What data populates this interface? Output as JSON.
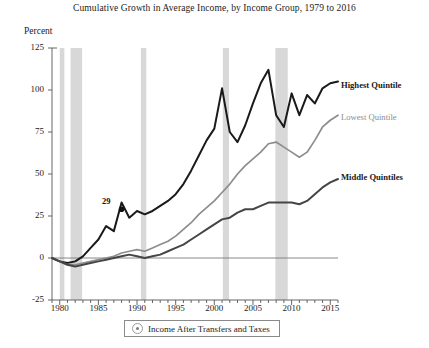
{
  "chart_data": {
    "type": "line",
    "title": "Cumulative Growth in Average Income, by Income Group, 1979 to 2016",
    "ylabel": "Percent",
    "xlabel": "",
    "xlim": [
      1979,
      2016
    ],
    "ylim": [
      -25,
      125
    ],
    "grid": false,
    "legend_position": "bottom-center",
    "legend_entries": [
      "Income After Transfers and Taxes"
    ],
    "legend_icon": "target-circle-icon",
    "y_ticks": [
      -25,
      0,
      25,
      50,
      75,
      100,
      125
    ],
    "y_tick_labels": [
      "-25",
      "0",
      "25",
      "50",
      "75",
      "100",
      "125"
    ],
    "x_ticks": [
      1980,
      1985,
      1990,
      1995,
      2000,
      2005,
      2010,
      2015
    ],
    "x_tick_labels": [
      "1980",
      "1985",
      "1990",
      "1995",
      "2000",
      "2005",
      "2010",
      "2015"
    ],
    "x_minor_ticks": [
      1979,
      1980,
      1981,
      1982,
      1983,
      1984,
      1985,
      1986,
      1987,
      1988,
      1989,
      1990,
      1991,
      1992,
      1993,
      1994,
      1995,
      1996,
      1997,
      1998,
      1999,
      2000,
      2001,
      2002,
      2003,
      2004,
      2005,
      2006,
      2007,
      2008,
      2009,
      2010,
      2011,
      2012,
      2013,
      2014,
      2015,
      2016
    ],
    "zero_line": 0,
    "colors": {
      "highest_quintile": "#1a1a1a",
      "lowest_quintile": "#8d8d8d",
      "middle_quintiles": "#454545",
      "recession_band": "#d8d8d8",
      "axis": "#555555",
      "zero_line": "#7b7b7b"
    },
    "recession_bands": [
      {
        "start": 1980.0,
        "end": 1980.6
      },
      {
        "start": 1981.4,
        "end": 1982.9
      },
      {
        "start": 1990.5,
        "end": 1991.2
      },
      {
        "start": 2001.1,
        "end": 2001.9
      },
      {
        "start": 2007.9,
        "end": 2009.5
      }
    ],
    "annotations": [
      {
        "label": "29",
        "series": "Highest Quintile",
        "x": 1988,
        "y": 29
      }
    ],
    "x": [
      1979,
      1980,
      1981,
      1982,
      1983,
      1984,
      1985,
      1986,
      1987,
      1988,
      1989,
      1990,
      1991,
      1992,
      1993,
      1994,
      1995,
      1996,
      1997,
      1998,
      1999,
      2000,
      2001,
      2002,
      2003,
      2004,
      2005,
      2006,
      2007,
      2008,
      2009,
      2010,
      2011,
      2012,
      2013,
      2014,
      2015,
      2016
    ],
    "series": [
      {
        "name": "Highest Quintile",
        "color": "#1a1a1a",
        "emphasis": "bold",
        "values": [
          0,
          -2,
          -3,
          -2,
          1,
          6,
          11,
          19,
          16,
          33,
          24,
          28,
          26,
          28,
          31,
          34,
          38,
          44,
          52,
          61,
          70,
          77,
          101,
          75,
          69,
          79,
          92,
          104,
          112,
          85,
          78,
          98,
          85,
          97,
          92,
          101,
          104,
          105
        ]
      },
      {
        "name": "Lowest Quintile",
        "color": "#8d8d8d",
        "emphasis": "regular",
        "values": [
          0,
          -2,
          -4,
          -4,
          -3,
          -2,
          -1,
          0,
          1,
          3,
          4,
          5,
          4,
          6,
          8,
          10,
          13,
          17,
          21,
          26,
          30,
          34,
          39,
          44,
          50,
          55,
          59,
          63,
          68,
          69,
          66,
          63,
          60,
          63,
          70,
          78,
          82,
          85
        ]
      },
      {
        "name": "Middle Quintiles",
        "color": "#454545",
        "emphasis": "bold",
        "values": [
          0,
          -2,
          -4,
          -5,
          -4,
          -3,
          -2,
          -1,
          0,
          1,
          2,
          1,
          0,
          1,
          2,
          4,
          6,
          8,
          11,
          14,
          17,
          20,
          23,
          24,
          27,
          29,
          29,
          31,
          33,
          33,
          33,
          33,
          32,
          34,
          38,
          42,
          45,
          47
        ]
      }
    ]
  }
}
